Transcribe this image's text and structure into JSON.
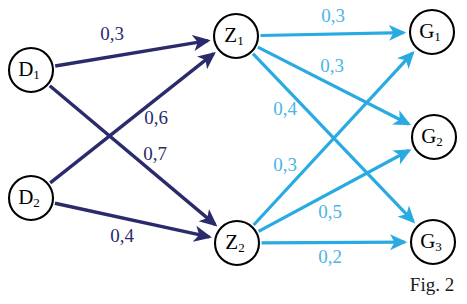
{
  "figure": {
    "caption": "Fig. 2",
    "caption_x": 432,
    "caption_y": 287,
    "width": 467,
    "height": 304,
    "background": "#ffffff"
  },
  "colors": {
    "dark_edge": "#2b2b6b",
    "light_edge": "#29abe2",
    "node_stroke": "#000000",
    "node_fill": "#ffffff",
    "label_dark": "#2b2b6b",
    "label_light": "#4ab5e6",
    "caption": "#1a1a1a"
  },
  "nodes": [
    {
      "id": "D1",
      "base": "D",
      "sub": "1",
      "x": 31,
      "y": 70,
      "r": 22
    },
    {
      "id": "D2",
      "base": "D",
      "sub": "2",
      "x": 31,
      "y": 198,
      "r": 22
    },
    {
      "id": "Z1",
      "base": "Z",
      "sub": "1",
      "x": 236,
      "y": 36,
      "r": 22
    },
    {
      "id": "Z2",
      "base": "Z",
      "sub": "2",
      "x": 237,
      "y": 243,
      "r": 22
    },
    {
      "id": "G1",
      "base": "G",
      "sub": "1",
      "x": 432,
      "y": 32,
      "r": 22
    },
    {
      "id": "G2",
      "base": "G",
      "sub": "2",
      "x": 434,
      "y": 137,
      "r": 22
    },
    {
      "id": "G3",
      "base": "G",
      "sub": "3",
      "x": 433,
      "y": 242,
      "r": 22
    }
  ],
  "edges": [
    {
      "from": "D1",
      "to": "Z1",
      "weight": "0,3",
      "style": "dark",
      "label_x": 112,
      "label_y": 36
    },
    {
      "from": "D1",
      "to": "Z2",
      "weight": "0,7",
      "style": "dark",
      "label_x": 155,
      "label_y": 156
    },
    {
      "from": "D2",
      "to": "Z1",
      "weight": "0,6",
      "style": "dark",
      "label_x": 156,
      "label_y": 120
    },
    {
      "from": "D2",
      "to": "Z2",
      "weight": "0,4",
      "style": "dark",
      "label_x": 122,
      "label_y": 238
    },
    {
      "from": "Z1",
      "to": "G1",
      "weight": "0,3",
      "style": "light",
      "label_x": 333,
      "label_y": 18
    },
    {
      "from": "Z1",
      "to": "G2",
      "weight": "0,3",
      "style": "light",
      "label_x": 332,
      "label_y": 68
    },
    {
      "from": "Z1",
      "to": "G3",
      "weight": "0,4",
      "style": "light",
      "label_x": 285,
      "label_y": 111
    },
    {
      "from": "Z2",
      "to": "G1",
      "weight": "0,3",
      "style": "light",
      "label_x": 285,
      "label_y": 167
    },
    {
      "from": "Z2",
      "to": "G2",
      "weight": "0,5",
      "style": "light",
      "label_x": 330,
      "label_y": 214
    },
    {
      "from": "Z2",
      "to": "G3",
      "weight": "0,2",
      "style": "light",
      "label_x": 330,
      "label_y": 259
    }
  ],
  "chart_data": {
    "type": "diagram",
    "title": "Fig. 2",
    "subtype": "weighted-directed-graph",
    "layers": [
      {
        "name": "inputs",
        "nodes": [
          "D1",
          "D2"
        ]
      },
      {
        "name": "hidden",
        "nodes": [
          "Z1",
          "Z2"
        ]
      },
      {
        "name": "outputs",
        "nodes": [
          "G1",
          "G2",
          "G3"
        ]
      }
    ],
    "weights": [
      {
        "source": "D1",
        "target": "Z1",
        "value": 0.3
      },
      {
        "source": "D1",
        "target": "Z2",
        "value": 0.7
      },
      {
        "source": "D2",
        "target": "Z1",
        "value": 0.6
      },
      {
        "source": "D2",
        "target": "Z2",
        "value": 0.4
      },
      {
        "source": "Z1",
        "target": "G1",
        "value": 0.3
      },
      {
        "source": "Z1",
        "target": "G2",
        "value": 0.3
      },
      {
        "source": "Z1",
        "target": "G3",
        "value": 0.4
      },
      {
        "source": "Z2",
        "target": "G1",
        "value": 0.3
      },
      {
        "source": "Z2",
        "target": "G2",
        "value": 0.5
      },
      {
        "source": "Z2",
        "target": "G3",
        "value": 0.2
      }
    ],
    "decimal_separator": ","
  }
}
